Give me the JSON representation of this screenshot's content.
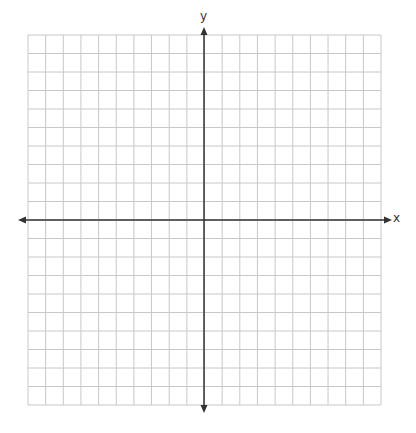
{
  "chart_data": {
    "type": "coordinate-plane",
    "title": "",
    "xlabel": "x",
    "ylabel": "y",
    "xlim": [
      -10,
      10
    ],
    "ylim": [
      -10,
      10
    ],
    "grid": true,
    "grid_columns": 20,
    "grid_rows": 20,
    "tick_labels": [],
    "axes_arrows": true,
    "series": []
  },
  "labels": {
    "x_axis": "x",
    "y_axis": "y"
  },
  "colors": {
    "grid": "#c8c8c8",
    "axis": "#333333",
    "background": "#ffffff"
  },
  "layout": {
    "grid_left": 28,
    "grid_right": 381,
    "grid_top": 35,
    "grid_bottom": 405,
    "origin_x": 204,
    "origin_y": 220,
    "x_axis_start": 18,
    "x_axis_end": 392,
    "y_axis_start": 27,
    "y_axis_end": 413
  }
}
